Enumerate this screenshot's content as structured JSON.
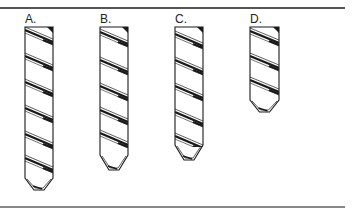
{
  "figure": {
    "rule_color": "#555555",
    "stroke_color": "#1a1a1a",
    "drills": [
      {
        "label": "A.",
        "x": 25,
        "top": 27,
        "width": 28,
        "body_bottom": 178,
        "tip": 190,
        "flutes": [
          30,
          56,
          82,
          108,
          134,
          158
        ]
      },
      {
        "label": "B.",
        "x": 100,
        "top": 27,
        "width": 28,
        "body_bottom": 155,
        "tip": 170,
        "flutes": [
          32,
          60,
          86,
          110,
          133
        ]
      },
      {
        "label": "C.",
        "x": 175,
        "top": 27,
        "width": 28,
        "body_bottom": 145,
        "tip": 160,
        "flutes": [
          34,
          60,
          86,
          112,
          136
        ]
      },
      {
        "label": "D.",
        "x": 250,
        "top": 27,
        "width": 29,
        "body_bottom": 100,
        "tip": 112,
        "flutes": [
          31,
          56,
          80
        ]
      }
    ]
  }
}
